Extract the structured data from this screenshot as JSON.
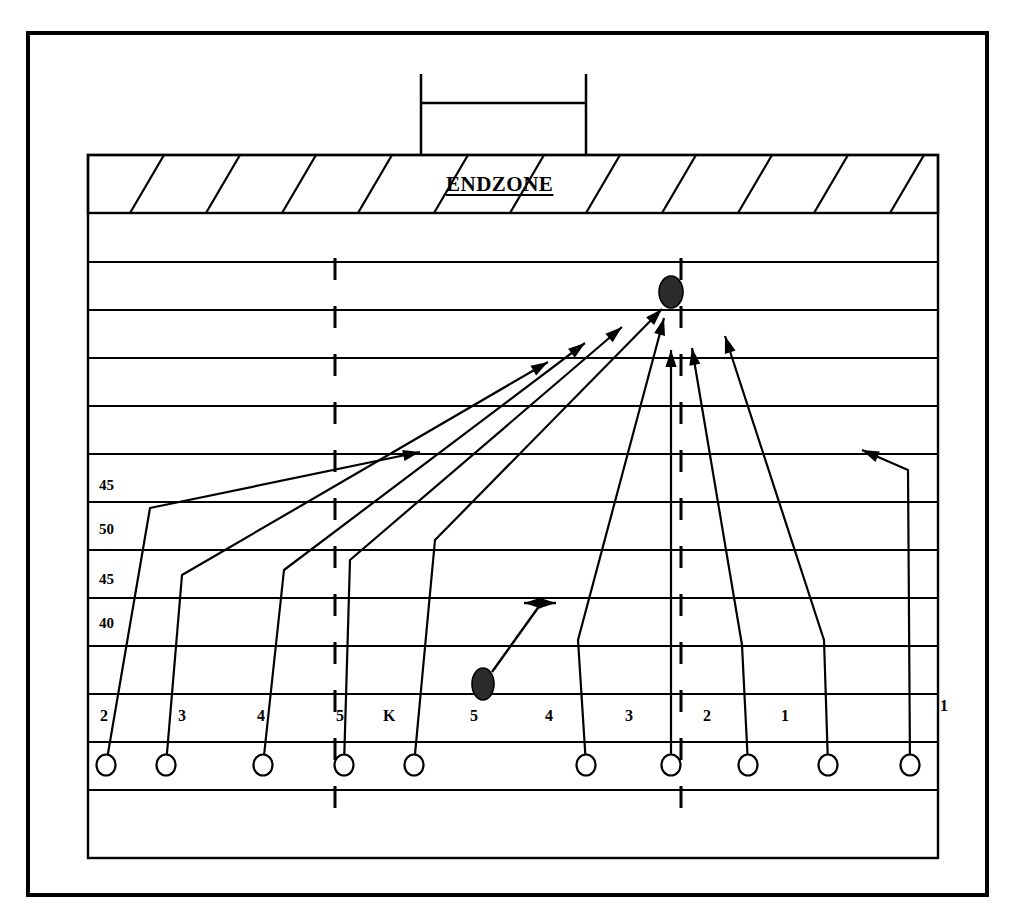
{
  "diagram": {
    "title": "ENDZONE",
    "type": "american-football-kickoff-coverage",
    "endzone_label": "ENDZONE",
    "yard_labels": [
      {
        "text": "45",
        "x": 99,
        "y": 478
      },
      {
        "text": "50",
        "x": 99,
        "y": 522
      },
      {
        "text": "45",
        "x": 99,
        "y": 572
      },
      {
        "text": "40",
        "x": 99,
        "y": 616
      }
    ],
    "position_labels": [
      {
        "text": "2",
        "x": 100,
        "y": 708
      },
      {
        "text": "3",
        "x": 178,
        "y": 708
      },
      {
        "text": "4",
        "x": 257,
        "y": 708
      },
      {
        "text": "5",
        "x": 336,
        "y": 708
      },
      {
        "text": "K",
        "x": 383,
        "y": 708
      },
      {
        "text": "5",
        "x": 470,
        "y": 708
      },
      {
        "text": "4",
        "x": 545,
        "y": 708
      },
      {
        "text": "3",
        "x": 625,
        "y": 708
      },
      {
        "text": "2",
        "x": 703,
        "y": 708
      },
      {
        "text": "1",
        "x": 781,
        "y": 708
      },
      {
        "text": "1",
        "x": 940,
        "y": 698
      }
    ],
    "players": [
      {
        "name": "player-2-left",
        "cx": 106,
        "cy": 765
      },
      {
        "name": "player-3-left",
        "cx": 166,
        "cy": 765
      },
      {
        "name": "player-4-left",
        "cx": 263,
        "cy": 765
      },
      {
        "name": "player-5-left",
        "cx": 344,
        "cy": 765
      },
      {
        "name": "player-kicker",
        "cx": 414,
        "cy": 765
      },
      {
        "name": "player-5-right",
        "cx": 586,
        "cy": 765
      },
      {
        "name": "player-4-right",
        "cx": 671,
        "cy": 765
      },
      {
        "name": "player-3-right",
        "cx": 748,
        "cy": 765
      },
      {
        "name": "player-2-right",
        "cx": 828,
        "cy": 765
      },
      {
        "name": "player-1-right",
        "cx": 910,
        "cy": 765
      }
    ],
    "balls": [
      {
        "name": "ball-target",
        "cx": 671,
        "cy": 292,
        "rx": 12,
        "ry": 16
      },
      {
        "name": "ball-landing",
        "cx": 483,
        "cy": 684,
        "rx": 11,
        "ry": 16
      }
    ],
    "field": {
      "outer_border": {
        "x": 28,
        "y": 33,
        "w": 959,
        "h": 862
      },
      "field_rect": {
        "x": 88,
        "y": 155,
        "w": 850,
        "h": 703
      },
      "endzone": {
        "x": 88,
        "y": 155,
        "w": 850,
        "h": 58
      },
      "hash_left_x": 335,
      "hash_right_x": 681,
      "yard_line_ys": [
        213,
        262,
        310,
        358,
        406,
        454,
        502,
        550,
        598,
        646,
        694,
        742,
        790,
        858
      ],
      "goalpost": {
        "left_x": 421,
        "right_x": 586,
        "top_y": 74,
        "crossbar_y": 103
      }
    },
    "colors": {
      "ink": "#000000",
      "paper": "#ffffff",
      "ball_fill": "#2b2b2b"
    }
  }
}
